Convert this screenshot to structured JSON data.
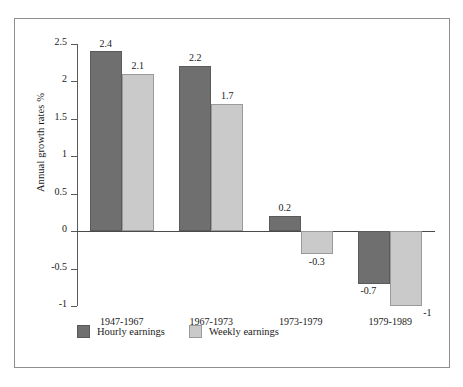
{
  "chart_data": {
    "type": "bar",
    "title": "",
    "xlabel": "",
    "ylabel": "Annual growth rates %",
    "categories": [
      "1947-1967",
      "1967-1973",
      "1973-1979",
      "1979-1989"
    ],
    "series": [
      {
        "name": "Hourly earnings",
        "color": "#6f6f6f",
        "values": [
          2.4,
          2.2,
          0.2,
          -0.7
        ],
        "labels": [
          "2.4",
          "2.2",
          "0.2",
          "-0.7"
        ]
      },
      {
        "name": "Weekly earnings",
        "color": "#cacaca",
        "values": [
          2.1,
          1.7,
          -0.3,
          -1
        ],
        "labels": [
          "2.1",
          "1.7",
          "-0.3",
          "-1"
        ]
      }
    ],
    "ylim": [
      -1,
      2.5
    ],
    "yticks": [
      2.5,
      2,
      1.5,
      1,
      0.5,
      0,
      -0.5,
      -1
    ],
    "ytick_labels": [
      "2.5",
      "2",
      "1.5",
      "1",
      "0.5",
      "0",
      "-0.5",
      "-1"
    ],
    "grid": false,
    "legend_position": "bottom-left",
    "zero_line": true
  },
  "figure": {
    "frame_border_color": "#8e8e8e",
    "background": "#ffffff",
    "axis_color": "#5a5a5a"
  },
  "slivers": {
    "top": "",
    "bottom": ""
  }
}
